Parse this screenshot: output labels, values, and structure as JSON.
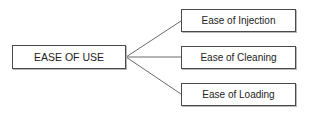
{
  "diagram": {
    "type": "tree",
    "root": {
      "label": "EASE OF USE"
    },
    "children": [
      {
        "label": "Ease of Injection"
      },
      {
        "label": "Ease of Cleaning"
      },
      {
        "label": "Ease of Loading"
      }
    ],
    "colors": {
      "line": "#6a6a6a",
      "border": "#4a4a4a",
      "text": "#222222",
      "background": "#ffffff"
    }
  }
}
